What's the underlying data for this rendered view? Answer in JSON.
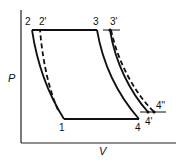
{
  "diagram": {
    "type": "P-V thermodynamic cycle diagram",
    "axes": {
      "y_label": "P",
      "x_label": "V"
    },
    "points": {
      "p1": {
        "label": "1"
      },
      "p2": {
        "label": "2"
      },
      "p2_prime": {
        "label": "2'"
      },
      "p3": {
        "label": "3"
      },
      "p3_prime": {
        "label": "3'"
      },
      "p4": {
        "label": "4"
      },
      "p4_prime": {
        "label": "4'"
      },
      "p4_double_prime": {
        "label": "4\""
      }
    },
    "line_styles": {
      "solid_cycle": "solid",
      "alternate_paths": "dashed"
    },
    "colors": {
      "line": "#111111",
      "background": "#ffffff"
    }
  }
}
